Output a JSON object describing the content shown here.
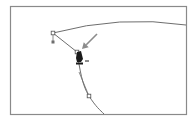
{
  "figure": {
    "frame": {
      "x": 10,
      "y": 6,
      "width": 176,
      "height": 108,
      "stroke": "#8a8a8a"
    },
    "colors": {
      "background": "#ffffff",
      "path": "#6e6e6e",
      "anchor_fill": "#ffffff",
      "anchor_stroke": "#555555",
      "handle": "#6e6e6e",
      "arrow": "#8c8c8c",
      "cursor": "#1a1a1a"
    },
    "paths": [
      {
        "name": "top-curve",
        "d": "M53 33 Q 120 15 186 25"
      },
      {
        "name": "left-segment",
        "d": "M53 33 L 77 52"
      },
      {
        "name": "lower-curve",
        "d": "M77 52 C 80 70, 82 85, 89 96 S 100 110, 104 114"
      }
    ],
    "anchors": [
      {
        "name": "anchor-top-left",
        "x": 53,
        "y": 33
      },
      {
        "name": "anchor-selected",
        "x": 77,
        "y": 52
      },
      {
        "name": "anchor-bottom",
        "x": 89,
        "y": 96
      }
    ],
    "handles": [
      {
        "name": "handle-top-left",
        "x1": 53,
        "y1": 33,
        "x2": 53,
        "y2": 42
      },
      {
        "name": "handle-lower",
        "x1": 79,
        "y1": 72,
        "x2": 89,
        "y2": 96
      }
    ],
    "pointer_arrow": {
      "from": [
        97,
        34
      ],
      "to": [
        82,
        49
      ]
    },
    "cursor": {
      "type": "pen-tool-cursor",
      "x": 80,
      "y": 56,
      "modifier": "minus"
    }
  }
}
